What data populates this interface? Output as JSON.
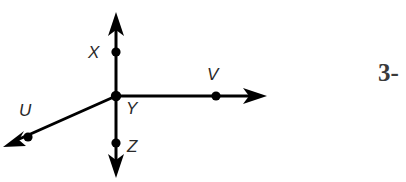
{
  "figure": {
    "type": "ray-diagram",
    "background_color": "#ffffff",
    "stroke_color": "#000000",
    "label_color": "#2a2a2a",
    "stroke_width": 3,
    "dot_radius": 4.5,
    "origin_label": "Y",
    "origin": {
      "x": 116,
      "y": 96
    },
    "rays": [
      {
        "name": "ray-up",
        "direction": "up",
        "tip": {
          "x": 116,
          "y": 12
        },
        "point_label": "X",
        "point": {
          "x": 116,
          "y": 52
        },
        "label_pos": {
          "x": 88,
          "y": 58
        }
      },
      {
        "name": "ray-right",
        "direction": "right",
        "tip": {
          "x": 267,
          "y": 96
        },
        "point_label": "V",
        "point": {
          "x": 216,
          "y": 96
        },
        "label_pos": {
          "x": 207,
          "y": 80
        }
      },
      {
        "name": "ray-down",
        "direction": "down",
        "tip": {
          "x": 116,
          "y": 178
        },
        "point_label": "Z",
        "point": {
          "x": 116,
          "y": 143
        },
        "label_pos": {
          "x": 127,
          "y": 152
        }
      },
      {
        "name": "ray-lower-left",
        "direction": "lower-left",
        "tip": {
          "x": 3,
          "y": 147
        },
        "point_label": "U",
        "point": {
          "x": 28,
          "y": 137
        },
        "label_pos": {
          "x": 19,
          "y": 116
        }
      }
    ],
    "origin_label_pos": {
      "x": 126,
      "y": 114
    }
  },
  "page_marker": {
    "text": "3-",
    "truncated": true
  }
}
